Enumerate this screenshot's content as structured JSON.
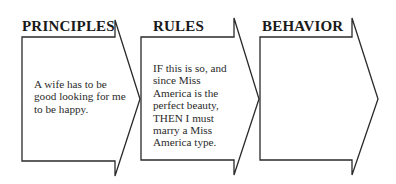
{
  "diagram": {
    "type": "process-flow-arrows",
    "stages": [
      {
        "title": "PRINCIPLES",
        "text": "A wife has to be good looking for me to be happy."
      },
      {
        "title": "RULES",
        "text": "IF this is so, and since Miss America is the perfect beauty, THEN I must marry a Miss America type."
      },
      {
        "title": "BEHAVIOR",
        "text": ""
      }
    ],
    "colors": {
      "stroke": "#2a2a2a",
      "background": "#ffffff",
      "text": "#1a1a1a"
    }
  }
}
